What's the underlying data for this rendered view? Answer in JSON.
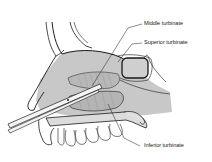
{
  "diagram": {
    "colors": {
      "line": "#1a1a1a",
      "tissue": "#c8c8c8",
      "turbinate": "#b4b4b4",
      "background": "#ffffff"
    },
    "labels": [
      {
        "id": "middle",
        "text": "Middle turbinate"
      },
      {
        "id": "superior",
        "text": "Superior turbinate"
      },
      {
        "id": "inferior",
        "text": "Inferior turbinate"
      }
    ]
  }
}
